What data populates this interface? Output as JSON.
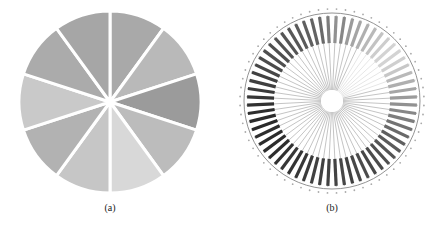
{
  "figure": {
    "panels": [
      {
        "id": "a",
        "caption": "(a)"
      },
      {
        "id": "b",
        "caption": "(b)"
      }
    ]
  },
  "chart_data": [
    {
      "type": "pie",
      "title": "",
      "caption": "(a)",
      "labels": [],
      "values": [
        1,
        1,
        1,
        1,
        1,
        1,
        1,
        1,
        1,
        1
      ],
      "start_angle_deg_from_top": 0,
      "direction": "clockwise",
      "colors": [
        "#a9a9a9",
        "#b9b9b9",
        "#9b9b9b",
        "#bcbcbc",
        "#d8d8d8",
        "#c6c6c6",
        "#b2b2b2",
        "#c9c9c9",
        "#ababab",
        "#a6a6a6"
      ]
    },
    {
      "type": "radial-bar",
      "title": "",
      "caption": "(b)",
      "n_spokes": 64,
      "note": "Tick labels around the ring are illegible at this resolution",
      "bar_intensity": [
        0.45,
        0.5,
        0.4,
        0.35,
        0.3,
        0.25,
        0.2,
        0.15,
        0.12,
        0.12,
        0.14,
        0.18,
        0.25,
        0.3,
        0.35,
        0.4,
        0.45,
        0.5,
        0.55,
        0.6,
        0.65,
        0.7,
        0.72,
        0.75,
        0.78,
        0.8,
        0.82,
        0.8,
        0.82,
        0.85,
        0.82,
        0.84,
        0.85,
        0.86,
        0.85,
        0.88,
        0.9,
        0.92,
        0.9,
        0.93,
        0.95,
        0.95,
        0.96,
        0.95,
        0.97,
        0.96,
        0.95,
        0.93,
        0.9,
        0.88,
        0.86,
        0.85,
        0.82,
        0.8,
        0.78,
        0.78,
        0.76,
        0.75,
        0.74,
        0.72,
        0.7,
        0.68,
        0.65,
        0.55
      ]
    }
  ]
}
